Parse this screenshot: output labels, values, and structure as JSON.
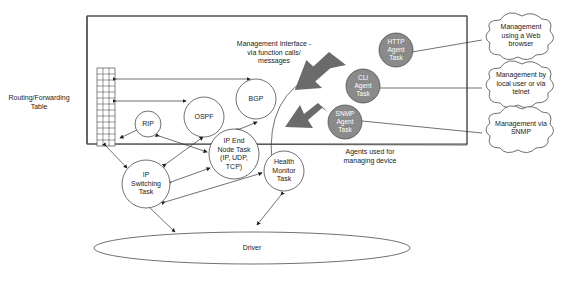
{
  "diagram": {
    "type": "network-device-architecture",
    "table_label": "Routing/Forwarding Table",
    "management_interface_label": "Management Interface - via function calls/ messages",
    "agents_caption": "Agents used for managing device",
    "protocol_tasks": [
      {
        "id": "rip",
        "label": "RIP"
      },
      {
        "id": "ospf",
        "label": "OSPF"
      },
      {
        "id": "bgp",
        "label": "BGP"
      },
      {
        "id": "ip_end_node",
        "label": "IP End Node Task (IP, UDP, TCP)"
      },
      {
        "id": "ip_switching",
        "label": "IP Switching Task"
      },
      {
        "id": "health_monitor",
        "label": "Health Monitor Task"
      }
    ],
    "driver": {
      "label": "Driver"
    },
    "agents": [
      {
        "id": "http",
        "label": "HTTP Agent Task"
      },
      {
        "id": "cli",
        "label": "CLI Agent Task"
      },
      {
        "id": "snmp",
        "label": "SNMP Agent Task"
      }
    ],
    "external_managers": [
      {
        "id": "web",
        "label": "Management using a Web browser"
      },
      {
        "id": "telnet",
        "label": "Management by local user or via telnet"
      },
      {
        "id": "snmp_mgr",
        "label": "Management via SNMP"
      }
    ],
    "colors": {
      "agent_fill": "#8a8a8a",
      "big_arrow": "#6b6b6b",
      "line": "#333333"
    }
  },
  "labels": {
    "table": [
      "Routing/Forwarding",
      "Table"
    ],
    "mgmt": [
      "Management Interface -",
      "via function calls/",
      "messages"
    ],
    "agents_caption": [
      "Agents used for",
      "managing device"
    ],
    "rip": "RIP",
    "ospf": "OSPF",
    "bgp": "BGP",
    "ipend": [
      "IP End",
      "Node Task",
      "(IP, UDP,",
      "TCP)"
    ],
    "ipsw": [
      "IP",
      "Switching",
      "Task"
    ],
    "health": [
      "Health",
      "Monitor",
      "Task"
    ],
    "driver": "Driver",
    "http": [
      "HTTP",
      "Agent",
      "Task"
    ],
    "cli": [
      "CLI",
      "Agent",
      "Task"
    ],
    "snmp": [
      "SNMP",
      "Agent",
      "Task"
    ],
    "web": [
      "Management",
      "using a Web",
      "browser"
    ],
    "telnet": [
      "Management by",
      "local user or via",
      "telnet"
    ],
    "snmpmgr": [
      "Management via",
      "SNMP"
    ]
  }
}
